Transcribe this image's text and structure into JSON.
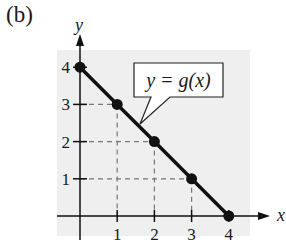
{
  "panel_label": "(b)",
  "chart_data": {
    "type": "line",
    "title": "",
    "xlabel": "x",
    "ylabel": "y",
    "x": [
      0,
      1,
      2,
      3,
      4
    ],
    "series": [
      {
        "name": "y = g(x)",
        "values": [
          4,
          3,
          2,
          1,
          0
        ]
      }
    ],
    "points": [
      [
        0,
        4
      ],
      [
        1,
        3
      ],
      [
        2,
        2
      ],
      [
        3,
        1
      ],
      [
        4,
        0
      ]
    ],
    "xticks": [
      "1",
      "2",
      "3",
      "4"
    ],
    "yticks": [
      "1",
      "2",
      "3",
      "4"
    ],
    "xlim": [
      -0.6,
      4.5
    ],
    "ylim": [
      -0.6,
      4.7
    ],
    "grid": false,
    "dashed_guides": true,
    "annotation": "y = g(x)",
    "legend": "none",
    "background": "#efefef",
    "line_color": "#111111"
  }
}
